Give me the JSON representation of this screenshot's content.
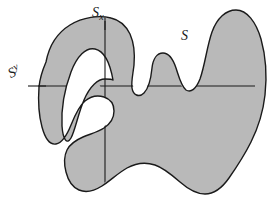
{
  "figure": {
    "labels": [
      {
        "id": "s-x",
        "base": "S",
        "sub": "x",
        "text": "Sx"
      },
      {
        "id": "s-y",
        "base": "S",
        "sup": "y",
        "text": "Sy"
      },
      {
        "id": "s",
        "base": "S",
        "text": "S"
      }
    ],
    "label_sx_base": "S",
    "label_sx_sub": "x",
    "label_sy_base": "S",
    "label_sy_sup": "y",
    "label_s_base": "S",
    "colors": {
      "fill": "#b9b9b9",
      "stroke": "#1a1a1a",
      "background": "#ffffff",
      "line": "#1a1a1a"
    },
    "cross_sections": {
      "vertical_x": 105,
      "vertical_y_top": 26,
      "vertical_y_bottom": 193,
      "horizontal_y": 86,
      "horizontal_x_left": 27,
      "horizontal_x_right": 246
    },
    "outer_boundary": "M 41,57 C 47,38 63,24 86,21 C 102,19 116,22 124,27 C 132,32 135,41 136,52 C 137,62 134,70 132,76 C 130,83 129,90 132,96 C 135,101 141,102 145,97 C 149,92 150,83 151,74 C 152,64 155,57 162,56 C 169,55 173,61 176,69 C 179,78 181,88 186,93 C 191,98 197,95 201,86 C 206,74 208,55 212,39 C 216,24 223,14 234,13 C 245,12 254,22 259,38 C 264,54 266,73 264,91 C 262,109 257,124 250,138 C 243,152 236,165 229,175 C 222,185 214,191 205,191 C 196,191 188,186 180,179 C 172,172 164,165 155,162 C 146,159 136,160 127,165 C 118,170 110,178 102,183 C 94,188 86,190 79,187 C 72,184 68,177 66,169 C 64,161 64,153 67,147 C 70,141 76,137 83,134 C 90,131 98,129 104,125 C 110,121 114,115 114,108 C 114,101 110,96 104,94 C 98,92 91,93 85,98 C 79,103 75,112 71,122 C 67,132 62,140 56,141 C 50,142 45,135 42,124 C 39,113 38,98 38,84 C 38,73 38,65 41,57 Z",
    "hole_boundary": "M 101,96 C 96,79 89,68 80,68 C 71,68 64,79 60,97 C 56,115 55,131 58,133 C 61,135 65,126 70,113 C 75,100 81,92 88,92 C 95,92 100,96 101,96 Z"
  }
}
